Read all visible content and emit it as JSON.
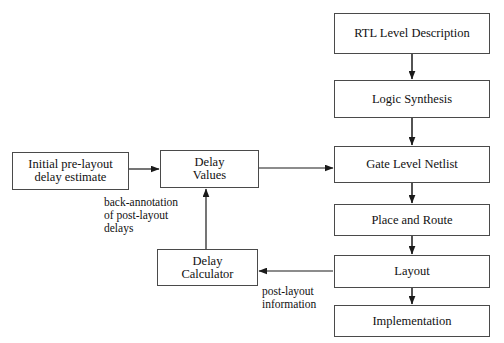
{
  "diagram": {
    "colors": {
      "background": "#ffffff",
      "node_border": "#4a4a4a",
      "node_fill": "#ffffff",
      "edge_stroke": "#1a1a1a",
      "text": "#111111"
    },
    "nodes": [
      {
        "id": "rtl",
        "label": "RTL Level Description"
      },
      {
        "id": "logic_synthesis",
        "label": "Logic Synthesis"
      },
      {
        "id": "gate_netlist",
        "label": "Gate Level Netlist"
      },
      {
        "id": "place_route",
        "label": "Place and Route"
      },
      {
        "id": "layout",
        "label": "Layout"
      },
      {
        "id": "implementation",
        "label": "Implementation"
      },
      {
        "id": "initial_estimate",
        "label": "Initial pre-layout\ndelay estimate"
      },
      {
        "id": "delay_values",
        "label": "Delay\nValues"
      },
      {
        "id": "delay_calculator",
        "label": "Delay\nCalculator"
      }
    ],
    "edges": [
      {
        "id": "e1",
        "from": "rtl",
        "to": "logic_synthesis",
        "label": ""
      },
      {
        "id": "e2",
        "from": "logic_synthesis",
        "to": "gate_netlist",
        "label": ""
      },
      {
        "id": "e3",
        "from": "gate_netlist",
        "to": "place_route",
        "label": ""
      },
      {
        "id": "e4",
        "from": "place_route",
        "to": "layout",
        "label": ""
      },
      {
        "id": "e5",
        "from": "layout",
        "to": "implementation",
        "label": ""
      },
      {
        "id": "e6",
        "from": "initial_estimate",
        "to": "delay_values",
        "label": ""
      },
      {
        "id": "e7",
        "from": "delay_values",
        "to": "gate_netlist",
        "label": ""
      },
      {
        "id": "e8",
        "from": "layout",
        "to": "delay_calculator",
        "label": "post-layout\ninformation"
      },
      {
        "id": "e9",
        "from": "delay_calculator",
        "to": "delay_values",
        "label": "back-annotation\nof post-layout\ndelays"
      }
    ],
    "edge_labels": {
      "back_annotation": "back-annotation\nof post-layout\ndelays",
      "post_layout_information": "post-layout\ninformation"
    }
  }
}
